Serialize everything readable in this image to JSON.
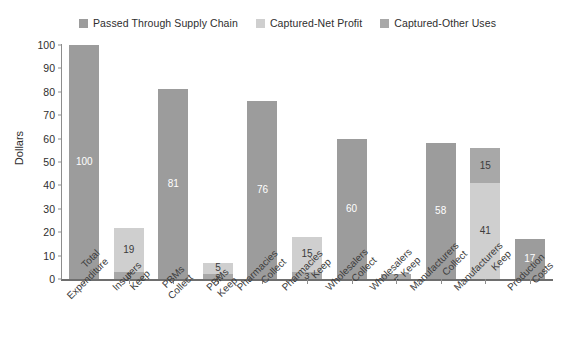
{
  "chart_data": {
    "type": "bar",
    "title": "",
    "subtitle": "",
    "xlabel": "",
    "ylabel": "Dollars",
    "ylim": [
      0,
      100
    ],
    "yticks": [
      0,
      10,
      20,
      30,
      40,
      50,
      60,
      70,
      80,
      90,
      100
    ],
    "grid": false,
    "stacked": true,
    "legend_position": "top-center",
    "legend": [
      {
        "name": "Passed Through Supply Chain",
        "color": "#9c9c9c"
      },
      {
        "name": "Captured-Net Profit",
        "color": "#cfcfcf"
      },
      {
        "name": "Captured-Other Uses",
        "color": "#a8a8a8"
      }
    ],
    "categories": [
      "Total Expenditure",
      "Insurers Keep",
      "PBMs Collect",
      "PBMs Keep",
      "Pharmacies Collect",
      "Pharmacies Keep",
      "Wholesalers Collect",
      "Wholesalers Keep",
      "Manufacturers Collect",
      "Manufacturers Keep",
      "Production Costs"
    ],
    "category_lines": [
      [
        "Total",
        "Expenditure"
      ],
      [
        "Insurers",
        "Keep"
      ],
      [
        "PBMs",
        "Collect"
      ],
      [
        "PBMs",
        "Keep"
      ],
      [
        "Pharmacies",
        "Collect"
      ],
      [
        "Pharmacies",
        "Keep"
      ],
      [
        "Wholesalers",
        "Collect"
      ],
      [
        "Wholesalers",
        "Keep"
      ],
      [
        "Manufacturers",
        "Collect"
      ],
      [
        "Manufacturers",
        "Keep"
      ],
      [
        "Production",
        "Costs"
      ]
    ],
    "series": [
      {
        "name": "Passed Through Supply Chain",
        "color": "#9c9c9c",
        "values": [
          100,
          0,
          81,
          0,
          76,
          0,
          60,
          0,
          58,
          0,
          17
        ]
      },
      {
        "name": "Captured-Net Profit",
        "color": "#cfcfcf",
        "values": [
          0,
          19,
          0,
          5,
          0,
          15,
          0,
          0,
          0,
          41,
          0
        ]
      },
      {
        "name": "Captured-Other Uses",
        "color": "#a8a8a8",
        "values": [
          0,
          3,
          0,
          2,
          0,
          3,
          0,
          2,
          0,
          15,
          0
        ]
      }
    ],
    "bars": [
      {
        "category": "Total Expenditure",
        "total": 100,
        "segments": [
          {
            "series": "Passed Through Supply Chain",
            "value": 100,
            "label": "100",
            "color": "#9c9c9c",
            "label_style": "on-dark",
            "label_pos": "inside"
          }
        ]
      },
      {
        "category": "Insurers Keep",
        "total": 22,
        "segments": [
          {
            "series": "Captured-Net Profit",
            "value": 19,
            "label": "19",
            "color": "#cfcfcf",
            "label_style": "on-light",
            "label_pos": "inside"
          },
          {
            "series": "Captured-Other Uses",
            "value": 3,
            "label": "3",
            "color": "#a8a8a8",
            "label_style": "on-light",
            "label_pos": "inside"
          }
        ]
      },
      {
        "category": "PBMs Collect",
        "total": 81,
        "segments": [
          {
            "series": "Passed Through Supply Chain",
            "value": 81,
            "label": "81",
            "color": "#9c9c9c",
            "label_style": "on-dark",
            "label_pos": "inside"
          }
        ]
      },
      {
        "category": "PBMs Keep",
        "total": 7,
        "segments": [
          {
            "series": "Captured-Net Profit",
            "value": 5,
            "label": "5",
            "color": "#cfcfcf",
            "label_style": "on-light",
            "label_pos": "inside"
          },
          {
            "series": "Captured-Other Uses",
            "value": 2,
            "label": "2",
            "color": "#a8a8a8",
            "label_style": "on-light",
            "label_pos": "inside"
          }
        ]
      },
      {
        "category": "Pharmacies Collect",
        "total": 76,
        "segments": [
          {
            "series": "Passed Through Supply Chain",
            "value": 76,
            "label": "76",
            "color": "#9c9c9c",
            "label_style": "on-dark",
            "label_pos": "inside"
          }
        ]
      },
      {
        "category": "Pharmacies Keep",
        "total": 18,
        "segments": [
          {
            "series": "Captured-Net Profit",
            "value": 15,
            "label": "15",
            "color": "#cfcfcf",
            "label_style": "on-light",
            "label_pos": "inside"
          },
          {
            "series": "Captured-Other Uses",
            "value": 3,
            "label": "3",
            "color": "#a8a8a8",
            "label_style": "on-light",
            "label_pos": "inside"
          }
        ]
      },
      {
        "category": "Wholesalers Collect",
        "total": 60,
        "segments": [
          {
            "series": "Passed Through Supply Chain",
            "value": 60,
            "label": "60",
            "color": "#9c9c9c",
            "label_style": "on-dark",
            "label_pos": "inside"
          }
        ]
      },
      {
        "category": "Wholesalers Keep",
        "total": 2,
        "segments": [
          {
            "series": "Captured-Other Uses",
            "value": 2,
            "label": "2",
            "color": "#a8a8a8",
            "label_style": "on-light",
            "label_pos": "inside"
          }
        ]
      },
      {
        "category": "Manufacturers Collect",
        "total": 58,
        "segments": [
          {
            "series": "Passed Through Supply Chain",
            "value": 58,
            "label": "58",
            "color": "#9c9c9c",
            "label_style": "on-dark",
            "label_pos": "inside"
          }
        ]
      },
      {
        "category": "Manufacturers Keep",
        "total": 56,
        "segments": [
          {
            "series": "Captured-Other Uses",
            "value": 15,
            "label": "15",
            "color": "#a8a8a8",
            "label_style": "on-light",
            "label_pos": "inside"
          },
          {
            "series": "Captured-Net Profit",
            "value": 41,
            "label": "41",
            "color": "#cfcfcf",
            "label_style": "on-light",
            "label_pos": "inside"
          }
        ]
      },
      {
        "category": "Production Costs",
        "total": 17,
        "segments": [
          {
            "series": "Passed Through Supply Chain",
            "value": 17,
            "label": "17",
            "color": "#9c9c9c",
            "label_style": "on-dark",
            "label_pos": "inside"
          }
        ]
      }
    ]
  }
}
